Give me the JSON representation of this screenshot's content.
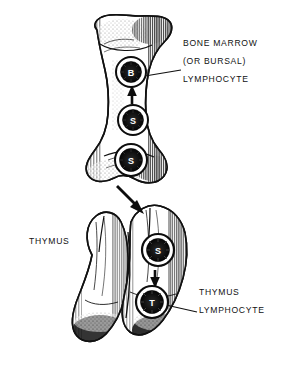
{
  "figure": {
    "background_color": "#ffffff",
    "ink_color": "#111111",
    "width": 287,
    "height": 372
  },
  "labels": {
    "bone_marrow": "BONE MARROW",
    "or_bursal": "(OR BURSAL)",
    "bone_marrow_lymphocyte": "LYMPHOCYTE",
    "thymus_organ": "THYMUS",
    "thymus_label": "THYMUS",
    "thymus_lymphocyte": "LYMPHOCYTE"
  },
  "cells": [
    {
      "id": "b-lymphocyte",
      "letter": "B",
      "organ": "bone-marrow",
      "cx": 131,
      "cy": 72,
      "r": 15
    },
    {
      "id": "stem-cell-mid",
      "letter": "S",
      "organ": "bone-marrow",
      "cx": 133,
      "cy": 120,
      "r": 15
    },
    {
      "id": "stem-cell-low",
      "letter": "S",
      "organ": "bone-marrow",
      "cx": 131,
      "cy": 160,
      "r": 16
    },
    {
      "id": "stem-cell-thymus",
      "letter": "S",
      "organ": "thymus",
      "cx": 158,
      "cy": 250,
      "r": 16
    },
    {
      "id": "t-lymphocyte",
      "letter": "T",
      "organ": "thymus",
      "cx": 152,
      "cy": 302,
      "r": 16
    }
  ],
  "arrows": [
    {
      "id": "stem-to-b-arrow",
      "from": "stem-cell-mid",
      "to": "b-lymphocyte",
      "direction": "up"
    },
    {
      "id": "marrow-to-thymus-arrow",
      "from": "bone-marrow",
      "to": "thymus",
      "direction": "down-right"
    },
    {
      "id": "stem-to-t-arrow",
      "from": "stem-cell-thymus",
      "to": "t-lymphocyte",
      "direction": "down"
    }
  ],
  "leader_lines": [
    {
      "id": "b-cell-leader",
      "from_cell": "b-lymphocyte",
      "to_label": "bone_marrow_lymphocyte"
    },
    {
      "id": "t-cell-leader",
      "from_cell": "t-lymphocyte",
      "to_label": "thymus_lymphocyte"
    }
  ],
  "organs": [
    {
      "id": "long-bone",
      "name": "bone marrow long bone"
    },
    {
      "id": "thymus-gland",
      "name": "thymus gland"
    }
  ]
}
